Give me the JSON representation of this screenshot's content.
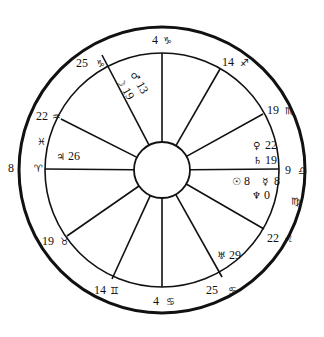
{
  "chart_data": {
    "type": "diagram",
    "title": "",
    "center": [
      162,
      170
    ],
    "radii": {
      "outer": 143,
      "inner": 117,
      "hub": 28
    },
    "cusps": [
      {
        "id": "asc",
        "degree": "8",
        "sign": "aries",
        "glyph": "♈",
        "end": [
          45,
          169
        ],
        "label_pos": [
          8,
          172
        ],
        "glyph_pos": [
          34,
          172
        ]
      },
      {
        "id": "h2",
        "degree": "19",
        "sign": "taurus",
        "glyph": "♉",
        "end": [
          67,
          236
        ],
        "label_pos": [
          42,
          245
        ],
        "glyph_pos": [
          60,
          245
        ]
      },
      {
        "id": "h3",
        "degree": "14",
        "sign": "gemini",
        "glyph": "♊",
        "end": [
          112,
          279
        ],
        "label_pos": [
          94,
          294
        ],
        "glyph_pos": [
          110,
          294
        ]
      },
      {
        "id": "ic",
        "degree": "4",
        "sign": "cancer",
        "glyph": "♋",
        "end": [
          162,
          287
        ],
        "label_pos": [
          153,
          305
        ],
        "glyph_pos": [
          166,
          305
        ]
      },
      {
        "id": "h5",
        "degree": "25",
        "sign": "cancer",
        "glyph": "♋",
        "end": [
          222,
          277
        ],
        "label_pos": [
          206,
          294
        ],
        "glyph_pos": [
          228,
          294
        ]
      },
      {
        "id": "h6",
        "degree": "22",
        "sign": "leo",
        "glyph": "♌",
        "end": [
          264,
          229
        ],
        "label_pos": [
          267,
          242
        ],
        "glyph_pos": [
          284,
          242
        ]
      },
      {
        "id": "dsc",
        "degree": "9",
        "sign": "libra",
        "glyph": "♎",
        "end": [
          279,
          169
        ],
        "label_pos": [
          285,
          174
        ],
        "glyph_pos": [
          298,
          174
        ]
      },
      {
        "id": "h8",
        "degree": "19",
        "sign": "scorpio",
        "glyph": "♏",
        "end": [
          263,
          114
        ],
        "label_pos": [
          267,
          114
        ],
        "glyph_pos": [
          285,
          114
        ]
      },
      {
        "id": "h9",
        "degree": "14",
        "sign": "sagittarius",
        "glyph": "♐",
        "end": [
          220,
          69
        ],
        "label_pos": [
          222,
          66
        ],
        "glyph_pos": [
          240,
          66
        ]
      },
      {
        "id": "mc",
        "degree": "4",
        "sign": "capricorn",
        "glyph": "♑",
        "end": [
          162,
          53
        ],
        "label_pos": [
          152,
          44
        ],
        "glyph_pos": [
          163,
          44
        ]
      },
      {
        "id": "h11",
        "degree": "25",
        "sign": "capricorn",
        "glyph": "♑",
        "end": [
          102,
          55
        ],
        "label_pos": [
          76,
          67
        ],
        "glyph_pos": [
          96,
          67
        ]
      },
      {
        "id": "h12",
        "degree": "22",
        "sign": "aquarius",
        "glyph": "♒",
        "end": [
          61,
          119
        ],
        "label_pos": [
          36,
          120
        ],
        "glyph_pos": [
          52,
          120
        ]
      }
    ],
    "intercepted_signs": [
      {
        "sign": "pisces",
        "glyph": "♓",
        "pos": [
          37,
          145
        ]
      },
      {
        "sign": "virgo",
        "glyph": "♍",
        "pos": [
          291,
          205
        ]
      }
    ],
    "planets": [
      {
        "name": "mars",
        "glyph": "♂",
        "degree": "13",
        "pos": [
          130,
          74
        ],
        "rotate": 60
      },
      {
        "name": "moon",
        "glyph": "☽",
        "degree": "19",
        "pos": [
          116,
          80
        ],
        "rotate": 60
      },
      {
        "name": "jupiter",
        "glyph": "♃",
        "degree": "26",
        "pos": [
          56,
          160
        ]
      },
      {
        "name": "venus",
        "glyph": "♀",
        "degree": "22",
        "pos": [
          253,
          149
        ]
      },
      {
        "name": "saturn",
        "glyph": "♄",
        "degree": "19",
        "pos": [
          253,
          164
        ]
      },
      {
        "name": "sun",
        "glyph": "☉",
        "degree": "8",
        "pos": [
          232,
          185
        ]
      },
      {
        "name": "mercury",
        "glyph": "☿",
        "degree": "8",
        "pos": [
          262,
          185
        ]
      },
      {
        "name": "neptune",
        "glyph": "♆",
        "degree": "0",
        "pos": [
          252,
          199
        ]
      },
      {
        "name": "uranus",
        "glyph": "♅",
        "degree": "29",
        "pos": [
          217,
          259
        ]
      }
    ]
  }
}
